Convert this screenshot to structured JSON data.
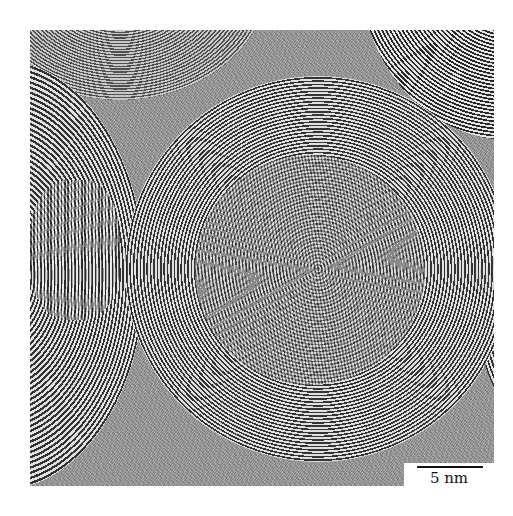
{
  "figure": {
    "type": "TEM micrograph",
    "scale_bar": {
      "label": "5 nm",
      "color": "#111111"
    }
  }
}
